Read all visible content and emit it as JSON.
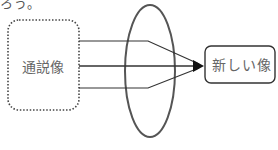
{
  "top_text": "ろう。",
  "diagram": {
    "source_box": {
      "label": "通説像",
      "style": "dotted"
    },
    "target_box": {
      "label": "新しい像",
      "style": "solid"
    },
    "lens": {
      "shape": "ellipse"
    },
    "arrows": 3,
    "colors": {
      "stroke": "#333333",
      "ellipse": "#555555",
      "text": "#666666"
    }
  }
}
